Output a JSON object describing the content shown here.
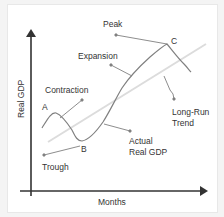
{
  "diagram": {
    "axes": {
      "x_label": "Months",
      "y_label": "Real GDP"
    },
    "labels": {
      "peak": "Peak",
      "expansion": "Expansion",
      "contraction": "Contraction",
      "trough": "Trough",
      "long_run_line1": "Long-Run",
      "long_run_line2": "Trend",
      "actual_line1": "Actual",
      "actual_line2": "Real GDP",
      "point_a": "A",
      "point_b": "B",
      "point_c": "C"
    },
    "colors": {
      "axis": "#333333",
      "curve": "#777777",
      "trend": "#dddddd",
      "leader": "#777777",
      "text": "#333333"
    }
  }
}
